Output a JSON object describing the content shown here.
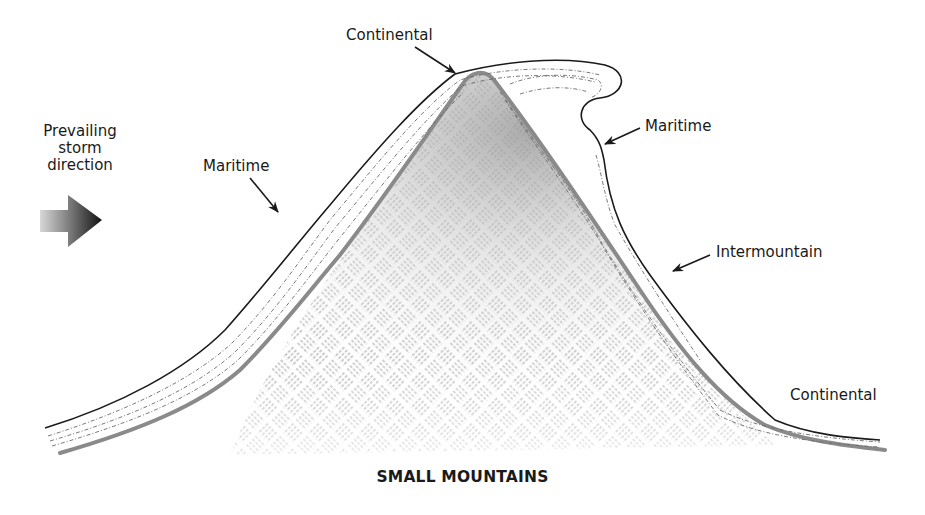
{
  "diagram": {
    "title": "SMALL MOUNTAINS",
    "storm": {
      "line1": "Prevailing",
      "line2": "storm",
      "line3": "direction",
      "icon": "right-arrow-icon"
    },
    "labels": {
      "continental_top": "Continental",
      "maritime_left": "Maritime",
      "maritime_right": "Maritime",
      "intermountain": "Intermountain",
      "continental_right": "Continental"
    },
    "colors": {
      "outline": "#1a1a1a",
      "ground": "#8a8a8a",
      "hatch": "#9a9a9a",
      "snow_dash": "#6a6a6a"
    }
  }
}
